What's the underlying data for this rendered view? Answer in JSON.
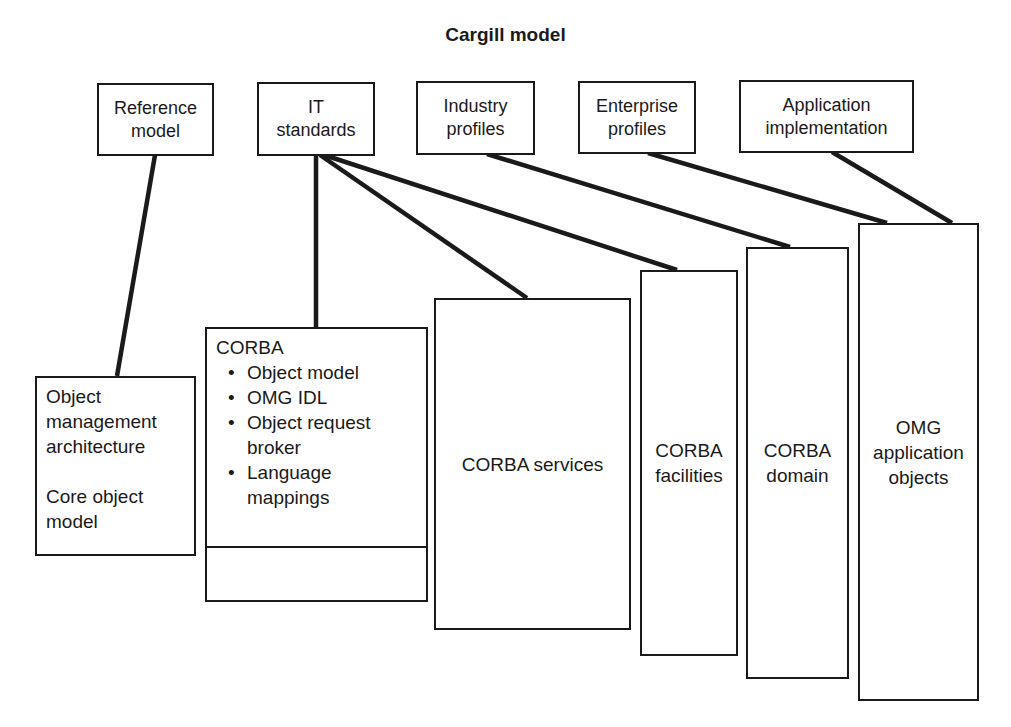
{
  "title": "Cargill model",
  "top_boxes": [
    {
      "line1": "Reference",
      "line2": "model"
    },
    {
      "line1": "IT",
      "line2": "standards"
    },
    {
      "line1": "Industry",
      "line2": "profiles"
    },
    {
      "line1": "Enterprise",
      "line2": "profiles"
    },
    {
      "line1": "Application",
      "line2": "implementation"
    }
  ],
  "oma_box": {
    "lines": [
      "Object",
      "management",
      "architecture"
    ],
    "lines2": [
      "Core object",
      "model"
    ]
  },
  "corba_box": {
    "heading": "CORBA",
    "bullets": [
      "Object model",
      "OMG IDL",
      "Object request broker",
      "Language mappings"
    ]
  },
  "services_box": {
    "label": "CORBA services"
  },
  "facilities_box": {
    "line1": "CORBA",
    "line2": "facilities"
  },
  "domain_box": {
    "line1": "CORBA",
    "line2": "domain"
  },
  "app_objects_box": {
    "line1": "OMG",
    "line2": "application",
    "line3": "objects"
  }
}
